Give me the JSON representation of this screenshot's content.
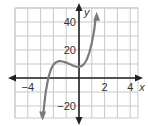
{
  "chart_data": {
    "type": "line",
    "title": "",
    "xlabel": "x",
    "ylabel": "y",
    "xlim": [
      -5,
      4.5
    ],
    "ylim": [
      -25,
      45
    ],
    "grid": true,
    "x_ticks": [
      {
        "value": -4,
        "label": "−4"
      },
      {
        "value": 2,
        "label": "2"
      },
      {
        "value": 4,
        "label": "4"
      }
    ],
    "y_ticks": [
      {
        "value": 40,
        "label": "40"
      },
      {
        "value": 20,
        "label": "20"
      },
      {
        "value": -20,
        "label": "−20"
      }
    ],
    "series": [
      {
        "name": "f(x)",
        "color": "#7a7a7a",
        "description": "cubic curve with arrows at both ends",
        "x": [
          -2.8,
          -2.6,
          -2.4,
          -2.2,
          -2.0,
          -1.8,
          -1.6,
          -1.4,
          -1.2,
          -1.0,
          -0.8,
          -0.6,
          -0.4,
          -0.2,
          0.0,
          0.2,
          0.4,
          0.6,
          0.8,
          1.0,
          1.2,
          1.3
        ],
        "y": [
          -26,
          -10,
          0,
          6,
          9.5,
          11.2,
          12,
          12,
          11.6,
          11,
          10.2,
          9.4,
          8.6,
          8.1,
          8,
          8.5,
          10,
          13,
          18,
          25,
          35,
          43
        ]
      }
    ],
    "annotations": [
      "arrowheads at both ends of curve and axes"
    ]
  }
}
